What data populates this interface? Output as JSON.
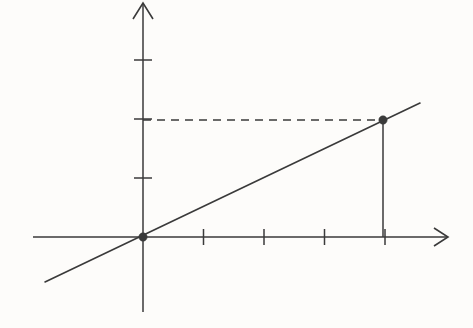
{
  "figure": {
    "title": "",
    "background_color": "#fdfcfa",
    "ink_color": "#3a3a3a",
    "canvas": {
      "width": 473,
      "height": 328
    }
  },
  "chart_data": {
    "type": "line",
    "title": "",
    "subtitle": "",
    "xlabel": "",
    "ylabel": "",
    "grid": false,
    "legend": null,
    "axes": {
      "x": {
        "origin_px": 143,
        "unit_px": 60.5,
        "tick_values": [
          1,
          2,
          3,
          4
        ],
        "tick_labels": [
          "",
          "",
          "",
          ""
        ],
        "arrow": "right",
        "xlim": [
          -1.82,
          5.04
        ],
        "draw_from_px": 33,
        "draw_to_px": 448,
        "axis_y_px": 237
      },
      "y": {
        "origin_px": 237,
        "unit_px": 59.0,
        "tick_values": [
          1,
          2,
          3
        ],
        "tick_labels": [
          "",
          "",
          ""
        ],
        "arrow": "up",
        "ylim": [
          -1.27,
          3.97
        ],
        "draw_from_px": 3,
        "draw_to_px": 312,
        "axis_x_px": 143
      }
    },
    "series": [
      {
        "name": "line",
        "kind": "line",
        "equation": "y = 0.5x",
        "slope": 0.5,
        "intercept": 0,
        "style": "solid",
        "x": [
          -1.62,
          4.58
        ],
        "y": [
          -0.81,
          2.29
        ],
        "px": {
          "x1": 45,
          "y1": 282,
          "x2": 420,
          "y2": 103
        }
      }
    ],
    "points": [
      {
        "name": "origin-point",
        "x": 0,
        "y": 0,
        "label": "",
        "marker": "filled-circle",
        "px": {
          "x": 143,
          "y": 237
        }
      },
      {
        "name": "marked-point",
        "x": 4,
        "y": 2,
        "label": "",
        "marker": "filled-circle",
        "px": {
          "x": 383,
          "y": 120
        }
      }
    ],
    "guides": [
      {
        "name": "horizontal-dashed-guide",
        "orientation": "horizontal",
        "style": "dashed",
        "from": {
          "x": 0,
          "y": 2
        },
        "to": {
          "x": 4,
          "y": 2
        },
        "px": {
          "x1": 143,
          "y1": 120,
          "x2": 383,
          "y2": 120
        }
      },
      {
        "name": "vertical-drop-guide",
        "orientation": "vertical",
        "style": "solid",
        "from": {
          "x": 4,
          "y": 2
        },
        "to": {
          "x": 4,
          "y": 0
        },
        "px": {
          "x1": 383,
          "y1": 120,
          "x2": 383,
          "y2": 237
        }
      }
    ],
    "annotations": []
  }
}
